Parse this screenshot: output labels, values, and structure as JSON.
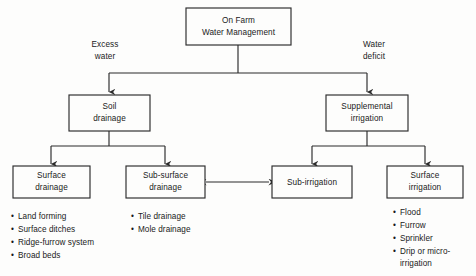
{
  "diagram": {
    "title": "On Farm Water Management",
    "type": "hierarchy-flow-chart",
    "colors": {
      "background": "#fdfdfc",
      "stroke": "#2b2b2b",
      "text": "#1a1a1a"
    },
    "root": {
      "id": "on-farm-water-management",
      "line1": "On Farm",
      "line2": "Water Management"
    },
    "branch_labels": {
      "left_line1": "Excess",
      "left_line2": "water",
      "right_line1": "Water",
      "right_line2": "deficit"
    },
    "level2": [
      {
        "id": "soil-drainage",
        "line1": "Soil",
        "line2": "drainage"
      },
      {
        "id": "supplemental-irrigation",
        "line1": "Supplemental",
        "line2": "irrigation"
      }
    ],
    "level3": [
      {
        "id": "surface-drainage",
        "line1": "Surface",
        "line2": "drainage"
      },
      {
        "id": "sub-surface-drainage",
        "line1": "Sub-surface",
        "line2": "drainage"
      },
      {
        "id": "sub-irrigation",
        "line1": "Sub-irrigation",
        "line2": ""
      },
      {
        "id": "surface-irrigation",
        "line1": "Surface",
        "line2": "irrigation"
      }
    ],
    "bullet_lists": {
      "surface_drainage": [
        "Land forming",
        "Surface ditches",
        "Ridge-furrow system",
        "Broad beds"
      ],
      "sub_surface_drainage": [
        "Tile drainage",
        "Mole drainage"
      ],
      "surface_irrigation": [
        "Flood",
        "Furrow",
        "Sprinkler",
        "Drip or micro-",
        "irrigation"
      ]
    },
    "bullet_mark": "•",
    "relations": {
      "bidirectional_note": "Sub-surface drainage ↔ Sub-irrigation"
    }
  }
}
